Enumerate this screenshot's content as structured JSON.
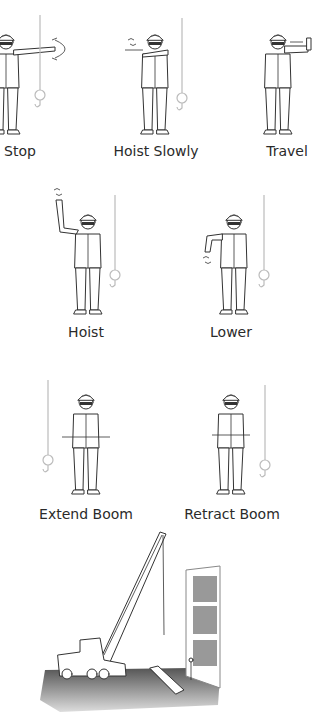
{
  "signals": [
    {
      "label": "Stop",
      "x": 20,
      "y": 153
    },
    {
      "label": "Hoist Slowly",
      "x": 156,
      "y": 153
    },
    {
      "label": "Travel",
      "x": 287,
      "y": 153
    },
    {
      "label": "Hoist",
      "x": 86,
      "y": 334
    },
    {
      "label": "Lower",
      "x": 231,
      "y": 334
    },
    {
      "label": "Extend Boom",
      "x": 86,
      "y": 516
    },
    {
      "label": "Retract Boom",
      "x": 232,
      "y": 516
    }
  ],
  "scene": {
    "description": "Mobile lattice-boom crane lifting beside building frame with load on ground"
  },
  "colors": {
    "line": "#333333",
    "hook": "#bbbbbb",
    "ground": "#6a6a6a",
    "text": "#2a2a2a"
  }
}
